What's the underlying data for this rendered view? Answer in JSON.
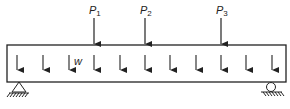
{
  "diagram": {
    "type": "simply supported beam with point loads and distributed load",
    "beam": {
      "x1": 7,
      "y1": 45,
      "x2": 286,
      "y2": 82
    },
    "point_loads": [
      {
        "label": "P",
        "sub": "1",
        "x": 94
      },
      {
        "label": "P",
        "sub": "2",
        "x": 145
      },
      {
        "label": "P",
        "sub": "3",
        "x": 221
      }
    ],
    "distributed_load": {
      "label": "w",
      "arrow_x": [
        17,
        43,
        69,
        94,
        120,
        145,
        170,
        196,
        221,
        246,
        272
      ]
    },
    "supports": [
      {
        "type": "pin",
        "x": 19
      },
      {
        "type": "roller",
        "x": 271
      }
    ],
    "colors": {
      "stroke": "#222222",
      "background": "#ffffff"
    }
  }
}
